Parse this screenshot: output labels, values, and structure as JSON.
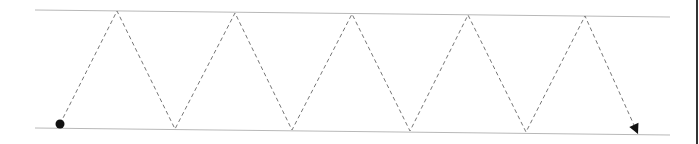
{
  "diagram": {
    "type": "zigzag-path",
    "colors": {
      "guide_line": "#b8b8b8",
      "path": "#777777",
      "marker": "#111111",
      "border": "#333333"
    },
    "top_line": {
      "x1": 35,
      "y1": 10,
      "x2": 670,
      "y2": 17
    },
    "bottom_line": {
      "x1": 35,
      "y1": 128,
      "x2": 670,
      "y2": 135
    },
    "start_point": {
      "x": 60,
      "y": 124
    },
    "peaks": [
      {
        "x": 117,
        "y": 11
      },
      {
        "x": 235,
        "y": 13
      },
      {
        "x": 352,
        "y": 14
      },
      {
        "x": 468,
        "y": 15
      },
      {
        "x": 585,
        "y": 16
      }
    ],
    "valleys": [
      {
        "x": 175,
        "y": 129
      },
      {
        "x": 292,
        "y": 130
      },
      {
        "x": 410,
        "y": 131
      },
      {
        "x": 526,
        "y": 132
      }
    ],
    "end_point": {
      "x": 638,
      "y": 134
    },
    "start_marker": "filled-circle",
    "end_marker": "arrowhead"
  }
}
